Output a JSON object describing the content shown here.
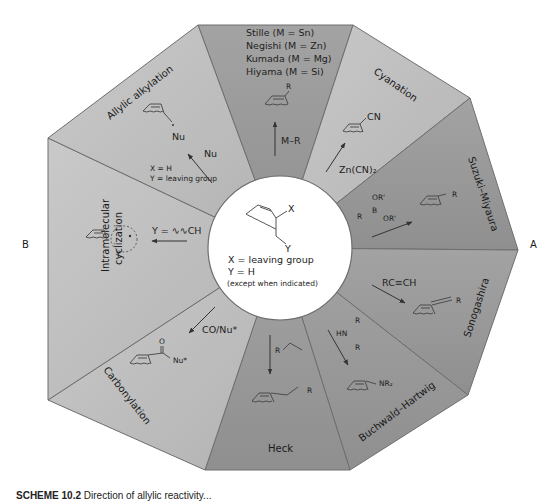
{
  "center": {
    "substituent_x": "X",
    "substituent_y": "Y",
    "line1": "X = leaving group",
    "line2": "Y = H",
    "line3": "(except when indicated)"
  },
  "vertex_labels": {
    "right": "A",
    "left": "B"
  },
  "sectors": [
    {
      "name": "top-cross-coupling",
      "title_lines": [
        "Stille (M = Sn)",
        "Negishi (M = Zn)",
        "Kumada (M = Mg)",
        "Hiyama (M = Si)"
      ],
      "reagent": "M–R",
      "product_sub": "R"
    },
    {
      "name": "cyanation",
      "title": "Cyanation",
      "reagent": "Zn(CN)₂",
      "product_sub": "CN"
    },
    {
      "name": "suzuki-miyaura",
      "title": "Suzuki–Miyaura",
      "reagent_lines": [
        "OR'",
        "R",
        "B",
        "OR'"
      ],
      "product_sub": "R"
    },
    {
      "name": "sonogashira",
      "title": "Sonogashira",
      "reagent": "RC≡CH",
      "product_sub": "R"
    },
    {
      "name": "buchwald-hartwig",
      "title": "Buchwald–Hartwig",
      "reagent_lines": [
        "R",
        "HN",
        "R"
      ],
      "product_sub": "NR₂"
    },
    {
      "name": "heck",
      "title": "Heck",
      "reagent": "R",
      "product_sub": "R"
    },
    {
      "name": "carbonylation",
      "title": "Carbonylation",
      "reagent": "CO/Nu*",
      "product_o": "O",
      "product_sub": "Nu*"
    },
    {
      "name": "intramolecular-cyclization",
      "title_lines": [
        "Intramolecular",
        "cyclization"
      ],
      "reagent": "Y = ∿∿CH",
      "product_sub": "Y"
    },
    {
      "name": "allylic-alkylation",
      "title": "Allylic alkylation",
      "reagent": "Nu",
      "note_lines": [
        "X = H",
        "Y = leaving group"
      ],
      "product_sub": "Nu"
    }
  ],
  "caption": {
    "label": "SCHEME 10.2",
    "text": "Direction of allylic reactivity..."
  },
  "colors": {
    "sector_dark": "#9a9a9a",
    "sector_light": "#bdbdbd",
    "border": "#6e6e6e",
    "center_fill": "#ffffff"
  }
}
